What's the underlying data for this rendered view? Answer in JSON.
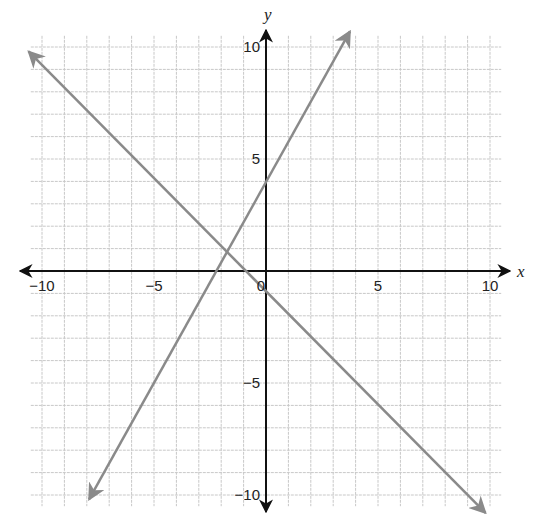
{
  "chart_data": {
    "type": "line",
    "title": "",
    "xlabel": "x",
    "ylabel": "y",
    "xlim": [
      -10.5,
      10.5
    ],
    "ylim": [
      -10.5,
      10.5
    ],
    "grid": true,
    "grid_step": 1,
    "x_ticks": [
      -10,
      -5,
      0,
      5,
      10
    ],
    "y_ticks": [
      -10,
      -5,
      5,
      10
    ],
    "x_tick_labels": [
      "−10",
      "−5",
      "0",
      "5",
      "10"
    ],
    "y_tick_labels": [
      "−10",
      "−5",
      "5",
      "10"
    ],
    "legend": null,
    "series": [
      {
        "name": "line-increasing",
        "equation": "y = 2x + 4",
        "slope": 2,
        "intercept": 4,
        "x": [
          -7.9,
          3.75
        ],
        "y": [
          -10.2,
          10.7
        ],
        "color": "#8a8a8a",
        "arrows": "both"
      },
      {
        "name": "line-decreasing",
        "equation": "y = -x - 1",
        "slope": -1,
        "intercept": -1,
        "x": [
          -10.6,
          9.8
        ],
        "y": [
          9.8,
          -10.8
        ],
        "color": "#8a8a8a",
        "arrows": "both"
      }
    ],
    "annotations": [
      {
        "label": "intersection",
        "x": -1.67,
        "y": 0.67
      }
    ]
  },
  "labels": {
    "x_axis": "x",
    "y_axis": "y",
    "origin": "0"
  },
  "colors": {
    "grid": "#c8c8c8",
    "axes": "#111111",
    "lines": "#8a8a8a"
  }
}
